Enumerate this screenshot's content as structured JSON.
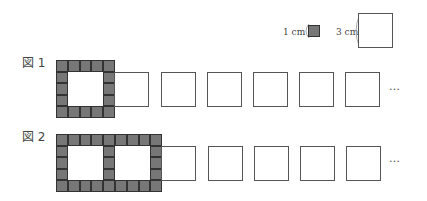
{
  "legend": {
    "small_label": "1 cm",
    "large_label": "3 cm",
    "small_color": "#777777"
  },
  "figures": [
    {
      "label": "図 1",
      "hollow_squares_in_frame": 1,
      "trailing_squares": 6,
      "ellipsis": "…"
    },
    {
      "label": "図 2",
      "hollow_squares_in_frame": 2,
      "trailing_squares": 5,
      "ellipsis": "…"
    }
  ]
}
